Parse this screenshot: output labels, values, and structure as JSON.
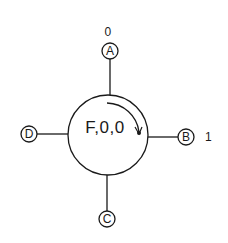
{
  "diagram": {
    "type": "node-port-diagram",
    "center_node": {
      "label": "F,0,0",
      "shape": "circle",
      "rotation_arrow": "clockwise"
    },
    "ports": [
      {
        "id": "A",
        "label": "A",
        "position": "top",
        "value": "0"
      },
      {
        "id": "B",
        "label": "B",
        "position": "right",
        "value": "1"
      },
      {
        "id": "C",
        "label": "C",
        "position": "bottom",
        "value": ""
      },
      {
        "id": "D",
        "label": "D",
        "position": "left",
        "value": ""
      }
    ],
    "colors": {
      "stroke": "#1a1a1a",
      "background": "#ffffff"
    }
  }
}
